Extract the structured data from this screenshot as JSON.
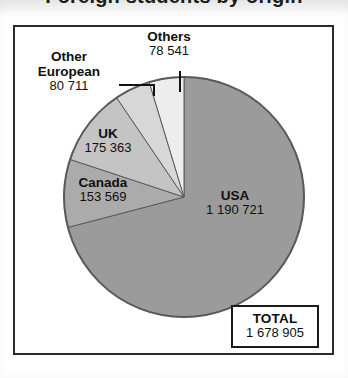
{
  "title": {
    "text": "Foreign students by origin",
    "visible": "partially-cropped"
  },
  "total_box": {
    "label": "TOTAL",
    "value": "1 678 905"
  },
  "labels": {
    "others": {
      "name": "Others",
      "value": "78 541"
    },
    "other_european": {
      "name": "Other European",
      "line1": "Other",
      "line2": "European",
      "value": "80 711"
    },
    "uk": {
      "name": "UK",
      "value": "175 363"
    },
    "canada": {
      "name": "Canada",
      "value": "153 569"
    },
    "usa": {
      "name": "USA",
      "value": "1 190 721"
    }
  },
  "colors": {
    "usa": "#9b9b9b",
    "canada": "#ababab",
    "uk": "#c4c4c4",
    "other_european": "#d7d7d7",
    "others": "#ededed",
    "outline": "#5a5a5a",
    "frame": "#2a2a2a",
    "text": "#0f0f0f"
  },
  "chart_data": {
    "type": "pie",
    "title": "Foreign students by origin",
    "categories": [
      "USA",
      "Canada",
      "UK",
      "Other European",
      "Others"
    ],
    "values": [
      1190721,
      153569,
      175363,
      80711,
      78541
    ],
    "value_labels": [
      "1 190 721",
      "153 569",
      "175 363",
      "80 711",
      "78 541"
    ],
    "total": 1678905,
    "total_label": "1 678 905",
    "percentages": [
      70.92,
      9.15,
      10.44,
      4.81,
      4.68
    ],
    "start_angle_deg": 0,
    "direction": "clockwise",
    "legend": "none",
    "labels_position": "inside-and-callout",
    "grid": false,
    "slice_colors": [
      "#9b9b9b",
      "#ababab",
      "#c4c4c4",
      "#d7d7d7",
      "#ededed"
    ]
  }
}
